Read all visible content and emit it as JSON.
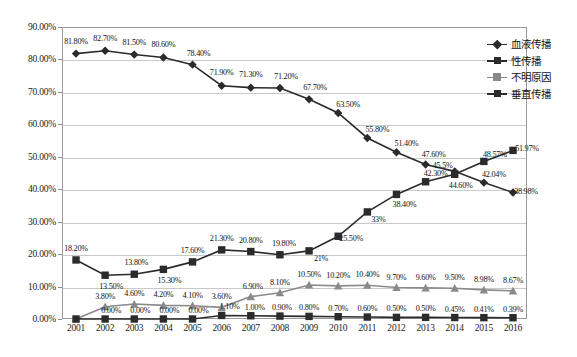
{
  "chart_data": {
    "type": "line",
    "title": "",
    "xlabel": "",
    "ylabel": "",
    "ylim": [
      0,
      90
    ],
    "grid": true,
    "legend_position": "right",
    "categories": [
      "2001",
      "2002",
      "2003",
      "2004",
      "2005",
      "2006",
      "2007",
      "2008",
      "2009",
      "2010",
      "2011",
      "2012",
      "2013",
      "2014",
      "2015",
      "2016"
    ],
    "y_ticks": [
      "0.00%",
      "10.00%",
      "20.00%",
      "30.00%",
      "40.00%",
      "50.00%",
      "60.00%",
      "70.00%",
      "80.00%",
      "90.00%"
    ],
    "series": [
      {
        "name": "血液传播",
        "marker": "diamond",
        "color": "#2b2b2b",
        "values": [
          81.8,
          82.7,
          81.5,
          80.6,
          78.4,
          71.9,
          71.3,
          71.2,
          67.7,
          63.5,
          55.8,
          51.4,
          47.6,
          45.5,
          42.04,
          38.98
        ],
        "labels": [
          "81.80%",
          "82.70%",
          "81.50%",
          "80.60%",
          "78.40%",
          "71.90%",
          "71.30%",
          "71.20%",
          "67.70%",
          "63.50%",
          "55.80%",
          "51.40%",
          "47.60%",
          "45.5%",
          "42.04%",
          "38.98%"
        ]
      },
      {
        "name": "性传播",
        "marker": "square",
        "color": "#2b2b2b",
        "values": [
          18.2,
          13.5,
          13.8,
          15.3,
          17.6,
          21.3,
          20.8,
          19.8,
          21.0,
          25.5,
          33.0,
          38.4,
          42.3,
          44.6,
          48.57,
          51.97
        ],
        "labels": [
          "18.20%",
          "13.50%",
          "13.80%",
          "15.30%",
          "17.60%",
          "21.30%",
          "20.80%",
          "19.80%",
          "21%",
          "25.50%",
          "33%",
          "38.40%",
          "42.30%",
          "44.60%",
          "48.57%",
          "51.97%"
        ]
      },
      {
        "name": "不明原因",
        "marker": "triangle",
        "color": "#8a8a8a",
        "values": [
          0.0,
          3.8,
          4.6,
          4.2,
          4.1,
          3.6,
          6.9,
          8.1,
          10.5,
          10.2,
          10.4,
          9.7,
          9.6,
          9.5,
          8.98,
          8.67
        ],
        "labels": [
          "",
          "3.80%",
          "4.60%",
          "4.20%",
          "4.10%",
          "3.60%",
          "6.90%",
          "8.10%",
          "10.50%",
          "10.20%",
          "10.40%",
          "9.70%",
          "9.60%",
          "9.50%",
          "8.98%",
          "8.67%"
        ]
      },
      {
        "name": "垂直传播",
        "marker": "square",
        "color": "#2b2b2b",
        "values": [
          0.0,
          0.0,
          0.0,
          0.0,
          0.0,
          1.1,
          1.0,
          0.9,
          0.8,
          0.7,
          0.6,
          0.5,
          0.5,
          0.45,
          0.41,
          0.39
        ],
        "labels": [
          "",
          "0.00%",
          "0.00%",
          "0.00%",
          "0.00%",
          "1.10%",
          "1.00%",
          "0.90%",
          "0.80%",
          "0.70%",
          "0.60%",
          "0.50%",
          "0.50%",
          "0.45%",
          "0.41%",
          "0.39%"
        ]
      }
    ],
    "label_offsets": {
      "blood": [
        [
          0,
          -13
        ],
        [
          0,
          -13
        ],
        [
          0,
          -13
        ],
        [
          0,
          -13
        ],
        [
          6,
          -12
        ],
        [
          0,
          -14
        ],
        [
          0,
          -14
        ],
        [
          6,
          -12
        ],
        [
          6,
          -12
        ],
        [
          10,
          -9
        ],
        [
          10,
          -9
        ],
        [
          10,
          -9
        ],
        [
          8,
          -11
        ],
        [
          -12,
          -6
        ],
        [
          10,
          -9
        ],
        [
          13,
          -2
        ]
      ],
      "sexual": [
        [
          0,
          -12
        ],
        [
          6,
          11
        ],
        [
          2,
          -12
        ],
        [
          6,
          11
        ],
        [
          0,
          -12
        ],
        [
          0,
          -12
        ],
        [
          0,
          -12
        ],
        [
          4,
          -12
        ],
        [
          12,
          7
        ],
        [
          13,
          2
        ],
        [
          11,
          7
        ],
        [
          8,
          10
        ],
        [
          10,
          -9
        ],
        [
          6,
          11
        ],
        [
          11,
          -7
        ],
        [
          14,
          -2
        ]
      ],
      "unknown": [
        [
          0,
          0
        ],
        [
          0,
          -11
        ],
        [
          0,
          -11
        ],
        [
          0,
          -11
        ],
        [
          0,
          -11
        ],
        [
          0,
          -11
        ],
        [
          2,
          -11
        ],
        [
          0,
          -11
        ],
        [
          0,
          -11
        ],
        [
          0,
          -11
        ],
        [
          0,
          -11
        ],
        [
          0,
          -11
        ],
        [
          0,
          -11
        ],
        [
          0,
          -11
        ],
        [
          0,
          -11
        ],
        [
          0,
          -11
        ]
      ],
      "vertical": [
        [
          0,
          0
        ],
        [
          6,
          -9
        ],
        [
          6,
          -9
        ],
        [
          6,
          -9
        ],
        [
          6,
          -9
        ],
        [
          8,
          -9
        ],
        [
          4,
          -9
        ],
        [
          2,
          -9
        ],
        [
          0,
          -9
        ],
        [
          0,
          -9
        ],
        [
          0,
          -9
        ],
        [
          0,
          -9
        ],
        [
          0,
          -9
        ],
        [
          0,
          -9
        ],
        [
          0,
          -9
        ],
        [
          0,
          -9
        ]
      ]
    }
  },
  "legend": {
    "items": [
      {
        "label": "血液传播",
        "marker": "diamond",
        "tone": "dark"
      },
      {
        "label": "性传播",
        "marker": "square",
        "tone": "dark"
      },
      {
        "label": "不明原因",
        "marker": "triangle",
        "tone": "gray"
      },
      {
        "label": "垂直传播",
        "marker": "square",
        "tone": "dark"
      }
    ]
  }
}
